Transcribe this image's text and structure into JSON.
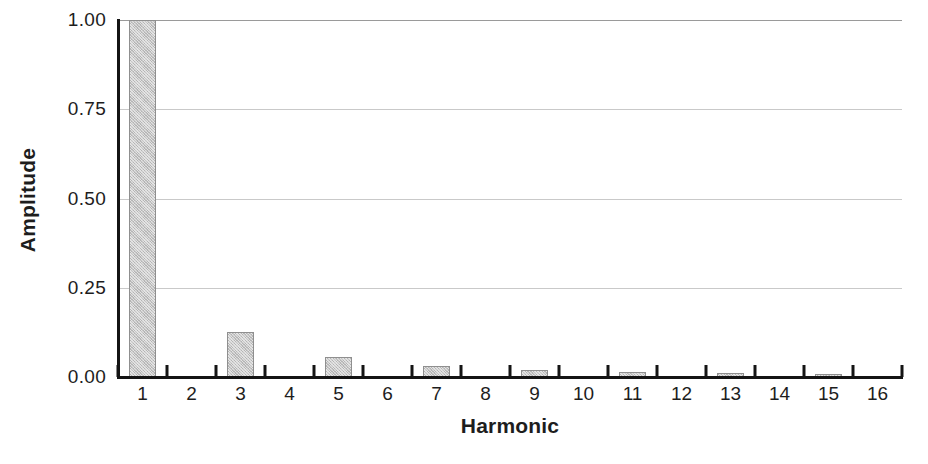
{
  "chart_data": {
    "type": "bar",
    "title": "",
    "xlabel": "Harmonic",
    "ylabel": "Amplitude",
    "categories": [
      "1",
      "2",
      "3",
      "4",
      "5",
      "6",
      "7",
      "8",
      "9",
      "10",
      "11",
      "12",
      "13",
      "14",
      "15",
      "16"
    ],
    "values": [
      1.0,
      0.0,
      0.125,
      0.0,
      0.056,
      0.0,
      0.031,
      0.0,
      0.02,
      0.0,
      0.014,
      0.0,
      0.01,
      0.0,
      0.008,
      0.0
    ],
    "ylim": [
      0.0,
      1.0
    ],
    "ytick_labels": [
      "0.00",
      "0.25",
      "0.50",
      "0.75",
      "1.00"
    ],
    "ytick_values": [
      0.0,
      0.25,
      0.5,
      0.75,
      1.0
    ],
    "grid": "horizontal",
    "legend": "none",
    "bar_fill_color": "#c6c6c6",
    "bar_edge_color": "#8f8f8f",
    "gridline_color": "#c9c9c9",
    "axis_color": "#141414"
  }
}
